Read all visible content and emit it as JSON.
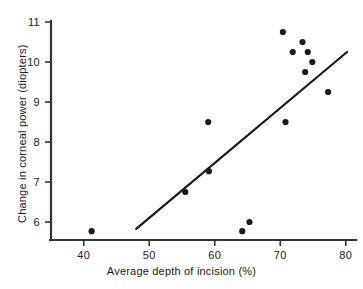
{
  "chart_data": {
    "type": "scatter",
    "title": "",
    "xlabel": "Average depth of incision (%)",
    "ylabel": "Change in corneal power (diopters)",
    "xlim": [
      35,
      81
    ],
    "ylim": [
      5.5,
      11.2
    ],
    "xticks": [
      40,
      50,
      60,
      70,
      80
    ],
    "yticks": [
      6,
      7,
      8,
      9,
      10,
      11
    ],
    "xtick_labels": [
      "40",
      "50",
      "60",
      "70",
      "80"
    ],
    "ytick_labels": [
      "6",
      "7",
      "8",
      "9",
      "10",
      "11"
    ],
    "grid": false,
    "legend": null,
    "marker_color": "#1a1a1a",
    "line_color": "#1a1a1a",
    "axis_color": "#333333",
    "background": "#ffffff",
    "points": [
      {
        "x": 41.2,
        "y": 5.77
      },
      {
        "x": 55.5,
        "y": 6.75
      },
      {
        "x": 59.1,
        "y": 7.27
      },
      {
        "x": 59.0,
        "y": 8.5
      },
      {
        "x": 64.2,
        "y": 5.77
      },
      {
        "x": 65.3,
        "y": 6.0
      },
      {
        "x": 70.4,
        "y": 10.75
      },
      {
        "x": 70.8,
        "y": 8.5
      },
      {
        "x": 71.9,
        "y": 10.25
      },
      {
        "x": 73.4,
        "y": 10.5
      },
      {
        "x": 73.8,
        "y": 9.75
      },
      {
        "x": 74.2,
        "y": 10.25
      },
      {
        "x": 74.9,
        "y": 10.0
      },
      {
        "x": 77.3,
        "y": 9.25
      }
    ],
    "regression_line": {
      "x_start": 48.0,
      "y_start": 5.83,
      "x_end": 80.2,
      "y_end": 10.25
    }
  },
  "axis": {
    "x_title": "Average depth of incision (%)",
    "y_title": "Change in corneal power (diopters)"
  }
}
